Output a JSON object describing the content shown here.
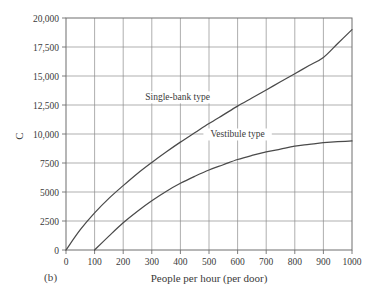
{
  "figure": {
    "panel_label": "(b)",
    "background_color": "#ffffff",
    "curve_color": "#4a4a4a",
    "grid_color": "#8d8d8d",
    "axis_color": "#6f6f6f",
    "text_color": "#3a3a3a"
  },
  "chart_data": {
    "type": "line",
    "title": "",
    "xlabel": "People per hour (per door)",
    "ylabel": "C",
    "xlim": [
      0,
      1000
    ],
    "ylim": [
      0,
      20000
    ],
    "grid": true,
    "legend_position": "inline-annotation",
    "x_ticks": [
      0,
      100,
      200,
      300,
      400,
      500,
      600,
      700,
      800,
      900,
      1000
    ],
    "x_tick_labels": [
      "0",
      "100",
      "200",
      "300",
      "400",
      "500",
      "600",
      "700",
      "800",
      "900",
      "1000"
    ],
    "y_ticks": [
      0,
      2500,
      5000,
      7500,
      10000,
      12500,
      15000,
      17500,
      20000
    ],
    "y_tick_labels": [
      "0",
      "2500",
      "5000",
      "7500",
      "10,000",
      "12,500",
      "15,000",
      "17,500",
      "20,000"
    ],
    "series": [
      {
        "name": "Single-bank type",
        "annotation": "Single-bank type",
        "annotation_x": 390,
        "annotation_y": 12900,
        "x": [
          0,
          50,
          100,
          150,
          200,
          250,
          300,
          350,
          400,
          450,
          500,
          550,
          600,
          650,
          700,
          750,
          800,
          850,
          900,
          950,
          1000
        ],
        "values": [
          0,
          1750,
          3200,
          4450,
          5550,
          6600,
          7550,
          8450,
          9300,
          10100,
          10900,
          11650,
          12400,
          13100,
          13800,
          14500,
          15200,
          15900,
          16600,
          17800,
          19000
        ]
      },
      {
        "name": "Vestibule type",
        "annotation": "Vestibule type",
        "annotation_x": 600,
        "annotation_y": 9700,
        "x": [
          100,
          150,
          200,
          250,
          300,
          350,
          400,
          450,
          500,
          550,
          600,
          650,
          700,
          750,
          800,
          850,
          900,
          950,
          1000
        ],
        "values": [
          0,
          1200,
          2350,
          3350,
          4250,
          5050,
          5750,
          6350,
          6900,
          7350,
          7800,
          8150,
          8450,
          8700,
          8950,
          9100,
          9250,
          9350,
          9400
        ]
      }
    ]
  }
}
